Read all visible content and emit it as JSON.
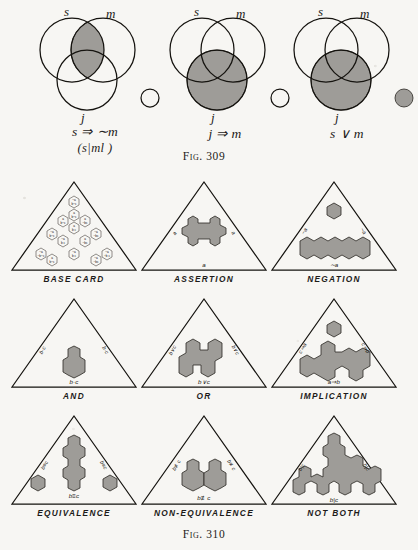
{
  "page": {
    "background_color": "#f7f6f3",
    "ink_color": "#15130f",
    "shade_color": "#9e9c98"
  },
  "fig309": {
    "caption": "Fig. 309",
    "diagrams": [
      {
        "name": "s-implies-not-m",
        "circle_labels": {
          "s": "s",
          "m": "m",
          "j": "j"
        },
        "formula": "s ⇒ ∼m",
        "formula_sub": "(s|ml )",
        "shaded_region": "s-and-m-lens",
        "outside_circle_shaded": false
      },
      {
        "name": "j-implies-m",
        "circle_labels": {
          "s": "s",
          "m": "m",
          "j": "j"
        },
        "formula": "j ⇒ m",
        "formula_sub": "",
        "shaded_region": "j-circle",
        "outside_circle_shaded": false
      },
      {
        "name": "s-or-m",
        "circle_labels": {
          "s": "s",
          "m": "m",
          "j": "j"
        },
        "formula": "s ∨ m",
        "formula_sub": "",
        "shaded_region": "j-circle",
        "outside_circle_shaded": true
      }
    ]
  },
  "fig310": {
    "caption": "Fig. 310",
    "cells": [
      {
        "caption": "BASE CARD",
        "bottom_label": "",
        "left_label": "",
        "right_label": "",
        "top_cell_label": "",
        "base_cell_labels": [
          "∼a b∼c",
          "a b∼c",
          "a b c",
          "a ∼b c",
          "∼a b∼c",
          "∼a b c",
          "a ∼b c",
          "∼a ∼b c",
          "∼a b c",
          "a ∼b ∼c"
        ]
      },
      {
        "caption": "ASSERTION",
        "bottom_label": "a",
        "left_label": "a",
        "right_label": "a",
        "top_cell_label": ""
      },
      {
        "caption": "NEGATION",
        "bottom_label": "∼a",
        "left_label": "∼a",
        "right_label": "∼a",
        "top_cell_label": ""
      },
      {
        "caption": "AND",
        "bottom_label": "b·c",
        "left_label": "b·c",
        "right_label": "b·c",
        "top_cell_label": ""
      },
      {
        "caption": "OR",
        "bottom_label": "b∨c",
        "left_label": "b∨c",
        "right_label": "b∨c",
        "top_cell_label": ""
      },
      {
        "caption": "IMPLICATION",
        "bottom_label": "a⇒b",
        "left_label": "c⇒a",
        "right_label": "c⇒b",
        "top_cell_label": ""
      },
      {
        "caption": "EQUIVALENCE",
        "bottom_label": "b≡c",
        "left_label": "b≡c",
        "right_label": "b≡c",
        "top_cell_label": ""
      },
      {
        "caption": "NON-EQUIVALENCE",
        "bottom_label": "b≢c",
        "left_label": "b≢c",
        "right_label": "b≢c",
        "top_cell_label": ""
      },
      {
        "caption": "NOT BOTH",
        "bottom_label": "b|c",
        "left_label": "b|c",
        "right_label": "b|c",
        "top_cell_label": ""
      }
    ]
  }
}
